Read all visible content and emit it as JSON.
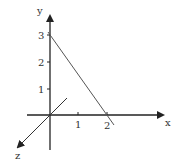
{
  "diagram": {
    "type": "3d-axes-with-line",
    "axes": {
      "x_label": "x",
      "y_label": "y",
      "z_label": "z"
    },
    "ticks": {
      "x": [
        "1",
        "2"
      ],
      "y": [
        "1",
        "2",
        "3"
      ]
    },
    "line": {
      "description": "line through (0,3) on y-axis and (2,0) on x-axis",
      "from": [
        0,
        3
      ],
      "to": [
        2,
        0
      ]
    },
    "colors": {
      "axis": "#222222",
      "line": "#555555",
      "text": "#333333"
    }
  }
}
